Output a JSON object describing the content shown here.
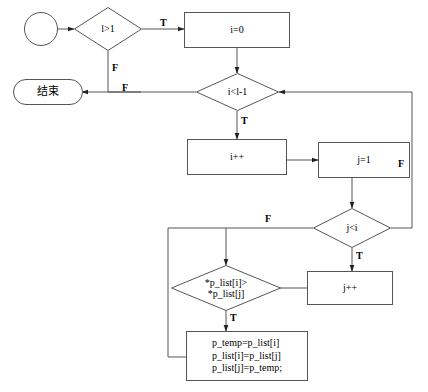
{
  "diagram": {
    "stroke_color": "#555555",
    "text_color": "#000000",
    "background": "#ffffff",
    "nodes": {
      "start": {
        "label": "",
        "shape": "circle"
      },
      "end": {
        "label": "结束",
        "shape": "terminal"
      },
      "cond_l_gt_1": {
        "label": "l>1",
        "shape": "decision"
      },
      "init_i": {
        "label": "i=0",
        "shape": "process"
      },
      "cond_i_lt_l_minus_1": {
        "label": "i<l-1",
        "shape": "decision"
      },
      "inc_i": {
        "label": "i++",
        "shape": "process"
      },
      "init_j": {
        "label": "j=1",
        "shape": "process"
      },
      "cond_j_lt_i": {
        "label": "j<i",
        "shape": "decision"
      },
      "inc_j": {
        "label": "j++",
        "shape": "process"
      },
      "cond_compare": {
        "label": "*p_list[i]>\n*p_list[j]",
        "shape": "decision"
      },
      "swap_block": {
        "label": "p_temp=p_list[i]\np_list[i]=p_list[j]\np_list[j]=p_temp;",
        "shape": "process",
        "lines": [
          "p_temp=p_list[i]",
          "p_list[i]=p_list[j]",
          "p_list[j]=p_temp;"
        ]
      }
    },
    "edge_labels": {
      "l_gt_1_true": "T",
      "l_gt_1_false": "F",
      "to_end_false": "F",
      "i_lt_l_true": "T",
      "j_lt_i_false": "F",
      "j_lt_i_true": "T",
      "outer_false": "F",
      "compare_true": "T"
    }
  }
}
